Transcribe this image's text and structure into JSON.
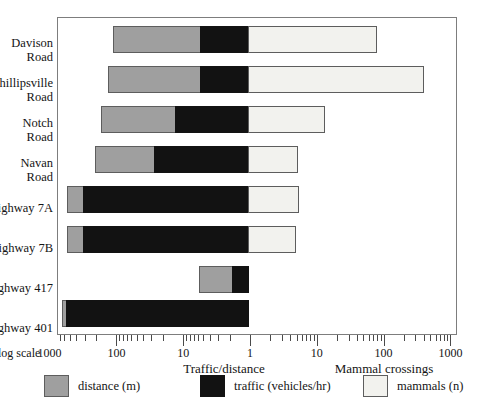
{
  "chart_data": {
    "type": "bar",
    "subtype": "diverging-stacked-log",
    "title": "",
    "categories": [
      "Davison\nRoad",
      "Phillipsville\nRoad",
      "Notch\nRoad",
      "Navan\nRoad",
      "Highway 7A",
      "Highway 7B",
      "Highway 417",
      "Highway 401"
    ],
    "series": [
      {
        "name": "distance (m)",
        "key": "distance",
        "color": "#9f9f9f",
        "axis": "left",
        "values": [
          21,
          25,
          13,
          8.1,
          1.8,
          1.8,
          3.2,
          1.2
        ]
      },
      {
        "name": "traffic (vehicles/hr)",
        "key": "traffic",
        "color": "#121212",
        "axis": "left",
        "values": [
          5.4,
          5.4,
          13,
          26,
          310,
          310,
          1.8,
          550
        ]
      },
      {
        "name": "mammals (n)",
        "key": "mammals",
        "color": "#f2f2ee",
        "axis": "right",
        "values": [
          85,
          430,
          14,
          5.7,
          5.9,
          5.2,
          0,
          0
        ]
      }
    ],
    "xlabel_left": "Traffic/distance",
    "xlabel_right": "Mammal crossings",
    "scale_note": "log scale",
    "xaxis": {
      "scale": "log",
      "left_ticks": [
        1000,
        100,
        10,
        1
      ],
      "right_ticks": [
        10,
        100,
        1000
      ],
      "pivot_value": 1,
      "minor_ticks": true
    },
    "grid": false,
    "legend_position": "bottom"
  },
  "axis": {
    "scale_note": "log scale",
    "tick_labels": [
      "1000",
      "100",
      "10",
      "1",
      "10",
      "100",
      "1000"
    ],
    "title_left": "Traffic/distance",
    "title_right": "Mammal crossings"
  },
  "legend": {
    "items": [
      {
        "label": "distance (m)",
        "key": "distance"
      },
      {
        "label": "traffic (vehicles/hr)",
        "key": "traffic"
      },
      {
        "label": "mammals (n)",
        "key": "mammals"
      }
    ]
  },
  "ylabels": [
    "Davison\nRoad",
    "Phillipsville\nRoad",
    "Notch\nRoad",
    "Navan\nRoad",
    "Highway 7A",
    "Highway 7B",
    "Highway 417",
    "Highway 401"
  ]
}
